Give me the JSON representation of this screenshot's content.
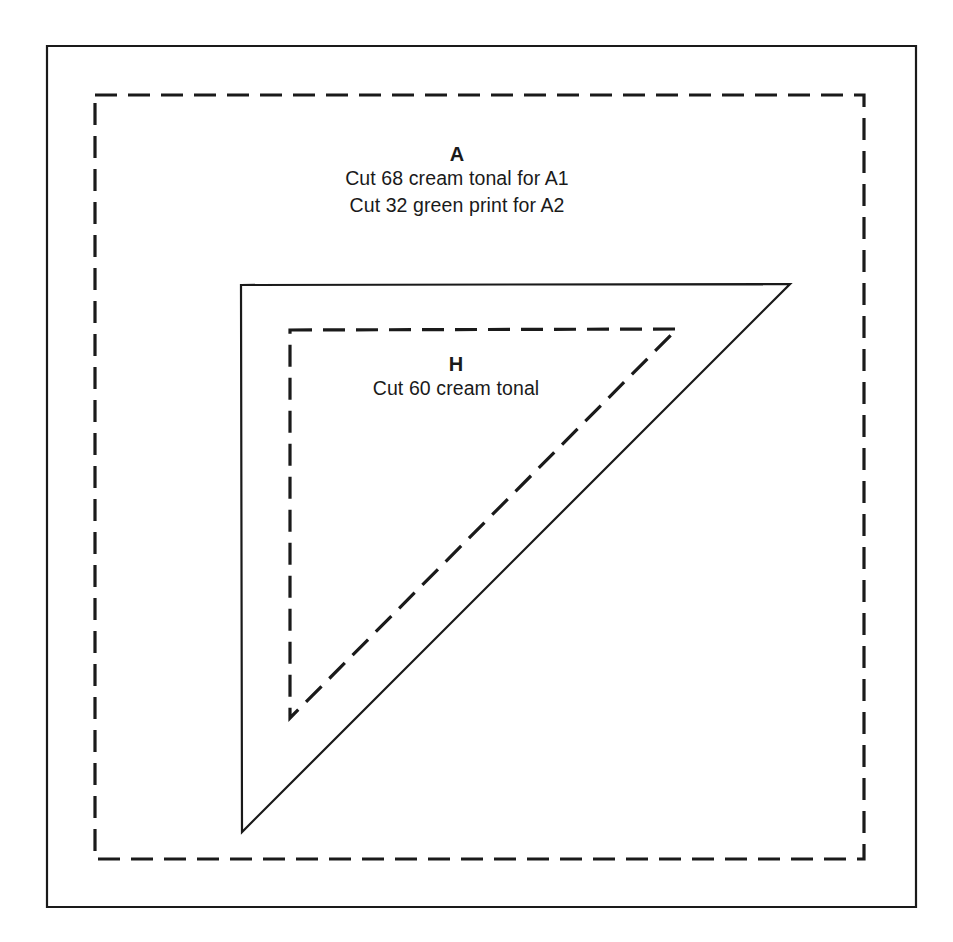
{
  "document": {
    "kind": "quilting-pattern-template",
    "background_color": "#ffffff",
    "line_color": "#1a1a1a"
  },
  "templates": [
    {
      "id": "template-a",
      "shape": "square",
      "letter": "A",
      "cut_instructions": [
        "Cut 68 cream tonal for A1",
        "Cut 32 green print for A2"
      ],
      "outline": {
        "style": "solid",
        "role": "cutting-line",
        "points": "47,46 916,46 916,907 47,907"
      },
      "seam_line": {
        "style": "dashed",
        "role": "seam-line",
        "points": "95,95 864,95 864,859 95,859"
      }
    },
    {
      "id": "template-h",
      "shape": "right-triangle",
      "letter": "H",
      "cut_instructions": [
        "Cut 60 cream tonal"
      ],
      "outline": {
        "style": "solid",
        "role": "cutting-line",
        "points": "241,285 790,284 242,832"
      },
      "seam_line": {
        "style": "dashed",
        "role": "seam-line",
        "points": "290,330 677,329 290,718"
      }
    }
  ],
  "labels": {
    "a_letter": "A",
    "a_line1": "Cut 68 cream tonal for A1",
    "a_line2": "Cut 32 green print for A2",
    "h_letter": "H",
    "h_line1": "Cut 60 cream tonal"
  },
  "stroke": {
    "solid_width": "2.2",
    "dashed_width": "3.2",
    "dash_array": "22 11"
  }
}
